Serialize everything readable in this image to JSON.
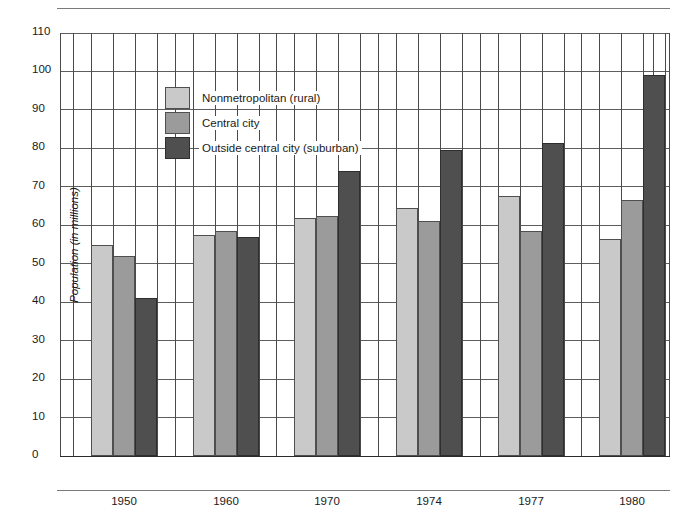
{
  "chart_data": {
    "type": "bar",
    "title": "",
    "xlabel": "",
    "ylabel": "Population (in millions)",
    "ylim": [
      0,
      110
    ],
    "ytick_step": 10,
    "yticks": [
      "0",
      "10",
      "20",
      "30",
      "40",
      "50",
      "60",
      "70",
      "80",
      "90",
      "100",
      "110"
    ],
    "categories": [
      "1950",
      "1960",
      "1970",
      "1974",
      "1977",
      "1980"
    ],
    "grid": "both",
    "legend_position": "upper-left-inside",
    "series": [
      {
        "name": "Nonmetropolitan (rural)",
        "color": "#c9c9c9",
        "values": [
          55.0,
          57.5,
          62.0,
          64.5,
          67.5,
          56.5
        ]
      },
      {
        "name": "Central city",
        "color": "#9b9b9b",
        "values": [
          52.0,
          58.5,
          62.5,
          61.0,
          58.5,
          66.5
        ]
      },
      {
        "name": "Outside central city (suburban)",
        "color": "#4f4f4f",
        "values": [
          41.0,
          57.0,
          74.0,
          79.5,
          81.5,
          99.0
        ]
      }
    ]
  },
  "legend": {
    "items": [
      {
        "label": "Nonmetropolitan (rural)"
      },
      {
        "label": "Central city"
      },
      {
        "label": "Outside central city (suburban)"
      }
    ]
  },
  "axes": {
    "y_label": "Population (in millions)",
    "y_ticks": [
      "110",
      "100",
      "90",
      "80",
      "70",
      "60",
      "50",
      "40",
      "30",
      "20",
      "10",
      "0"
    ],
    "x_ticks": [
      "1950",
      "1960",
      "1970",
      "1974",
      "1977",
      "1980"
    ]
  }
}
